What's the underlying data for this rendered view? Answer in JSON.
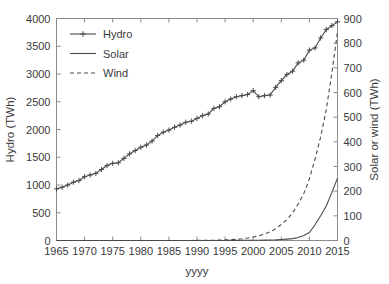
{
  "chart_data": {
    "type": "line",
    "title": "",
    "xlabel": "yyyy",
    "ylabel": "Hydro (TWh)",
    "y2label": "Solar or wind (TWh)",
    "xlim": [
      1965,
      2015
    ],
    "ylim": [
      0,
      4000
    ],
    "y2lim": [
      0,
      900
    ],
    "xticks": [
      1965,
      1970,
      1975,
      1980,
      1985,
      1990,
      1995,
      2000,
      2005,
      2010,
      2015
    ],
    "xticklabels": [
      "1965",
      "1970",
      "1975",
      "1980",
      "1985",
      "1990",
      "1995",
      "2000",
      "2005",
      "2010",
      "2015"
    ],
    "yticks": [
      0,
      500,
      1000,
      1500,
      2000,
      2500,
      3000,
      3500,
      4000
    ],
    "yticklabels": [
      "0",
      "500",
      "1000",
      "1500",
      "2000",
      "2500",
      "3000",
      "3500",
      "4000"
    ],
    "y2ticks": [
      0,
      100,
      200,
      300,
      400,
      500,
      600,
      700,
      800,
      900
    ],
    "y2ticklabels": [
      "0",
      "100",
      "200",
      "300",
      "400",
      "500",
      "600",
      "700",
      "800",
      "900"
    ],
    "grid": false,
    "legend_position": "upper left",
    "x": [
      1965,
      1966,
      1967,
      1968,
      1969,
      1970,
      1971,
      1972,
      1973,
      1974,
      1975,
      1976,
      1977,
      1978,
      1979,
      1980,
      1981,
      1982,
      1983,
      1984,
      1985,
      1986,
      1987,
      1988,
      1989,
      1990,
      1991,
      1992,
      1993,
      1994,
      1995,
      1996,
      1997,
      1998,
      1999,
      2000,
      2001,
      2002,
      2003,
      2004,
      2005,
      2006,
      2007,
      2008,
      2009,
      2010,
      2011,
      2012,
      2013,
      2014,
      2015
    ],
    "series": [
      {
        "name": "Hydro",
        "axis": "left",
        "style": "solid-plus-markers",
        "unit": "TWh",
        "values": [
          930,
          960,
          1000,
          1050,
          1080,
          1150,
          1180,
          1210,
          1280,
          1350,
          1390,
          1400,
          1480,
          1560,
          1620,
          1680,
          1720,
          1790,
          1890,
          1950,
          1990,
          2040,
          2080,
          2130,
          2150,
          2200,
          2250,
          2280,
          2380,
          2410,
          2500,
          2550,
          2590,
          2610,
          2630,
          2700,
          2590,
          2610,
          2620,
          2760,
          2880,
          2990,
          3050,
          3200,
          3250,
          3430,
          3470,
          3650,
          3800,
          3870,
          3940
        ]
      },
      {
        "name": "Solar",
        "axis": "right",
        "style": "solid",
        "unit": "TWh",
        "values": [
          0,
          0,
          0,
          0,
          0,
          0,
          0,
          0,
          0,
          0,
          0,
          0,
          0,
          0,
          0,
          0,
          0,
          0,
          0,
          0,
          0,
          0,
          0,
          0,
          0,
          0,
          0,
          0,
          0,
          0,
          0,
          0.6,
          0.7,
          0.8,
          0.9,
          1.1,
          1.3,
          1.6,
          2.0,
          2.7,
          4.0,
          5.5,
          7.5,
          12.0,
          20.0,
          32.0,
          64.0,
          100.0,
          140.0,
          195.0,
          253.0
        ]
      },
      {
        "name": "Wind",
        "axis": "right",
        "style": "dashed",
        "unit": "TWh",
        "values": [
          0,
          0,
          0,
          0,
          0,
          0,
          0,
          0,
          0,
          0,
          0,
          0,
          0,
          0,
          0,
          0,
          0,
          0,
          0,
          0,
          0,
          0,
          0.1,
          0.2,
          0.3,
          0.4,
          0.6,
          0.9,
          1.3,
          1.8,
          2.5,
          3.5,
          5.0,
          7.0,
          10.0,
          14.0,
          19.0,
          26.0,
          35.0,
          48.0,
          65.0,
          85.0,
          112.0,
          148.0,
          190.0,
          250.0,
          330.0,
          420.0,
          530.0,
          680.0,
          845.0
        ]
      }
    ],
    "legend": [
      {
        "label": "Hydro",
        "marker": "line-plus"
      },
      {
        "label": "Solar",
        "marker": "line-solid"
      },
      {
        "label": "Wind",
        "marker": "line-dashed"
      }
    ],
    "colors": {
      "line": "#4a4a4a",
      "axis": "#8c8c8c",
      "text": "#3a3a3a",
      "background": "#ffffff"
    }
  }
}
